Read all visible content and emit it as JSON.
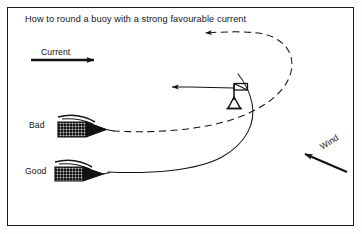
{
  "figure": {
    "title": "How to round a buoy with a strong favourable current",
    "width": 362,
    "height": 234,
    "background_color": "#ffffff",
    "border_color": "#1a1a1a",
    "ink_color": "#141414"
  },
  "labels": {
    "current": "Current",
    "wind": "Wind",
    "bad": "Bad",
    "good": "Good"
  },
  "elements": {
    "current_arrow": {
      "name": "current-arrow",
      "direction": "right",
      "style": "thick-solid",
      "meaning": "direction of tidal current"
    },
    "wind_arrow": {
      "name": "wind-arrow",
      "direction": "up-left",
      "style": "thick-solid",
      "angle_degrees": -32,
      "meaning": "direction wind is blowing from"
    },
    "buoy": {
      "name": "buoy-mark",
      "shape": "triangle-with-flag",
      "meaning": "the mark to be rounded"
    },
    "buoy_arrow": {
      "name": "buoy-current-arrow",
      "direction": "left",
      "style": "thin-solid",
      "meaning": "flow past the mark"
    },
    "bad_track": {
      "name": "bad-track",
      "style": "dashed",
      "meaning": "wide swinging approach that is swept past the mark"
    },
    "good_track": {
      "name": "good-track",
      "style": "solid",
      "meaning": "tight approach from below that rounds the mark close"
    },
    "bad_boat": {
      "name": "bad-boat",
      "hull": "hatched",
      "heading": "right"
    },
    "good_boat": {
      "name": "good-boat",
      "hull": "hatched",
      "heading": "right"
    }
  }
}
